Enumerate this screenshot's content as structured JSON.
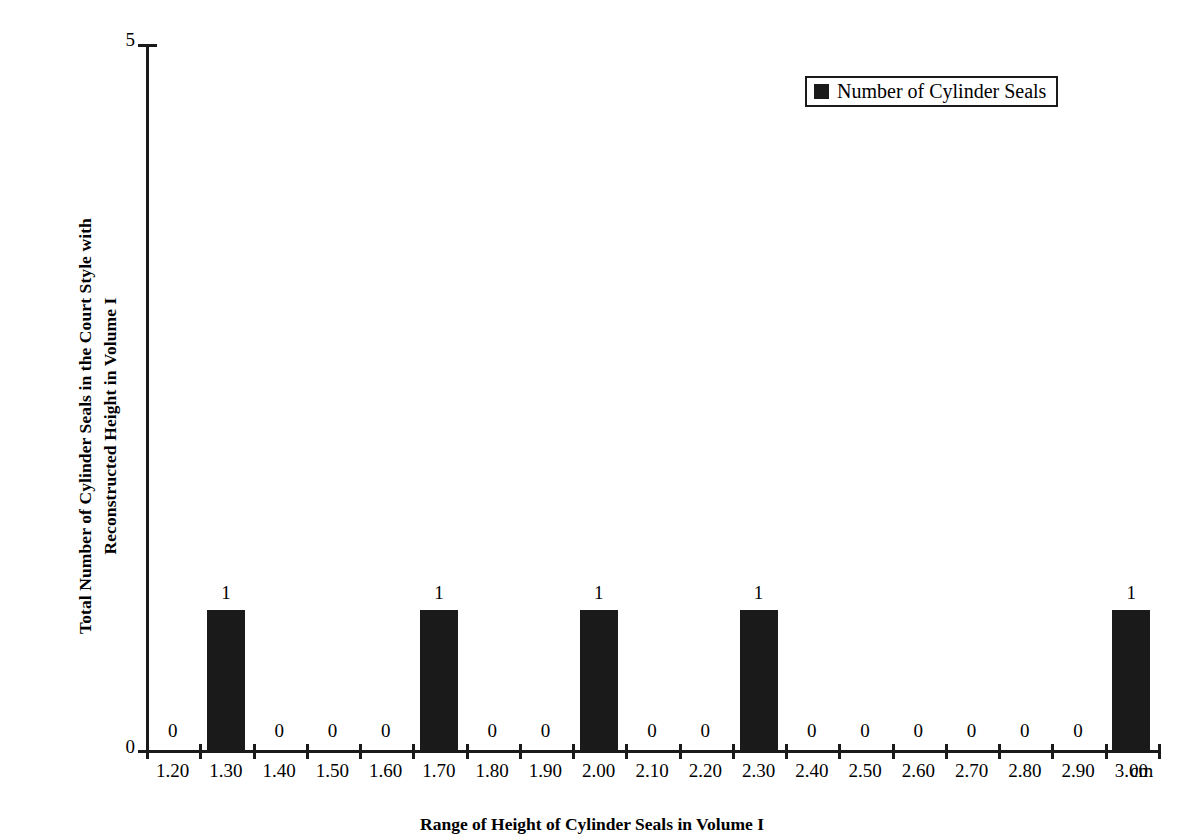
{
  "chart_data": {
    "type": "bar",
    "title": "",
    "xlabel": "Range of Height of Cylinder Seals in Volume I",
    "ylabel": "Total Number of Cylinder Seals in the Court Style with Reconstructed Height in Volume I",
    "ylabel_line1": "Total Number of Cylinder Seals in the Court Style with",
    "ylabel_line2": "Reconstructed Height in Volume I",
    "x_unit": "cm",
    "categories": [
      "1.20",
      "1.30",
      "1.40",
      "1.50",
      "1.60",
      "1.70",
      "1.80",
      "1.90",
      "2.00",
      "2.10",
      "2.20",
      "2.30",
      "2.40",
      "2.50",
      "2.60",
      "2.70",
      "2.80",
      "2.90",
      "3.00"
    ],
    "values": [
      0,
      1,
      0,
      0,
      0,
      1,
      0,
      0,
      1,
      0,
      0,
      1,
      0,
      0,
      0,
      0,
      0,
      0,
      1
    ],
    "data_labels": [
      "0",
      "1",
      "0",
      "0",
      "0",
      "1",
      "0",
      "0",
      "1",
      "0",
      "0",
      "1",
      "0",
      "0",
      "0",
      "0",
      "0",
      "0",
      "1"
    ],
    "series": [
      {
        "name": "Number of Cylinder Seals",
        "values": [
          0,
          1,
          0,
          0,
          0,
          1,
          0,
          0,
          1,
          0,
          0,
          1,
          0,
          0,
          0,
          0,
          0,
          0,
          1
        ]
      }
    ],
    "ylim": [
      0,
      5
    ],
    "y_ticks": [
      "0",
      "5"
    ],
    "y_tick_values": [
      0,
      5
    ],
    "grid": false,
    "legend_position": "top-right",
    "bar_color": "#1a1a1a",
    "axis_color": "#1a1a1a"
  },
  "legend": {
    "entries": [
      {
        "label": "Number of Cylinder Seals",
        "color": "#1a1a1a",
        "marker": "filled-square"
      }
    ]
  },
  "axes": {
    "y_title_line1": "Total Number of Cylinder Seals in the Court Style with",
    "y_title_line2": "Reconstructed Height in Volume I",
    "y_max_label": "5",
    "y_min_label": "0",
    "x_title": "Range of Height of Cylinder Seals in Volume I",
    "x_unit_label": "cm"
  }
}
